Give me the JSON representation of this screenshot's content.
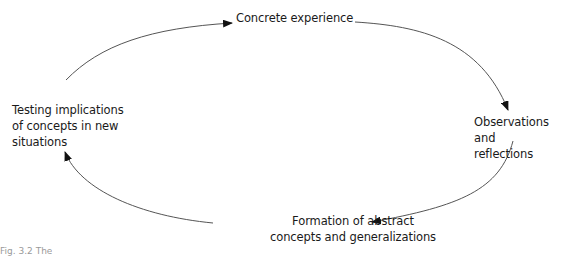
{
  "diagram": {
    "type": "cycle",
    "nodes": [
      {
        "id": "top",
        "lines": [
          "Concrete experience"
        ]
      },
      {
        "id": "right",
        "lines": [
          "Observations and",
          "reflections"
        ]
      },
      {
        "id": "bottom",
        "lines": [
          "Formation of abstract",
          "concepts and generalizations"
        ]
      },
      {
        "id": "left",
        "lines": [
          "Testing implications",
          "of concepts in new",
          "situations"
        ]
      }
    ],
    "edges": [
      {
        "from": "left",
        "to": "top"
      },
      {
        "from": "top",
        "to": "right"
      },
      {
        "from": "right",
        "to": "bottom"
      },
      {
        "from": "bottom",
        "to": "left"
      }
    ],
    "line_color": "#555555",
    "arrow_color": "#111111"
  },
  "caption": {
    "text": "Fig. 3.2  The"
  }
}
